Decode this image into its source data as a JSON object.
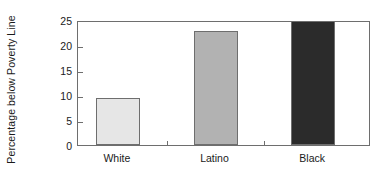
{
  "chart_data": {
    "type": "bar",
    "title": "",
    "subtitle": "",
    "xlabel": "",
    "ylabel": "Percentage below Poverty Line",
    "categories": [
      "White",
      "Latino",
      "Black"
    ],
    "values": [
      9.2,
      22.6,
      25.0
    ],
    "series": [
      {
        "name": "Percentage below Poverty Line",
        "values": [
          9.2,
          22.6,
          25.0
        ]
      }
    ],
    "ylim": [
      0,
      25
    ],
    "yticks": [
      0,
      5,
      10,
      15,
      20,
      25
    ],
    "ytick_labels": [
      "0",
      "5",
      "10",
      "15",
      "20",
      "25"
    ],
    "grid": false,
    "legend": false,
    "legend_position": "none",
    "bar_colors": [
      "#e6e6e6",
      "#b2b2b2",
      "#2b2b2b"
    ],
    "bar_edge_color": "#6e6e6e",
    "axis_color": "#6e6e6e",
    "background_color": "#ffffff",
    "text_color": "#1a1a1a",
    "annotations": []
  }
}
